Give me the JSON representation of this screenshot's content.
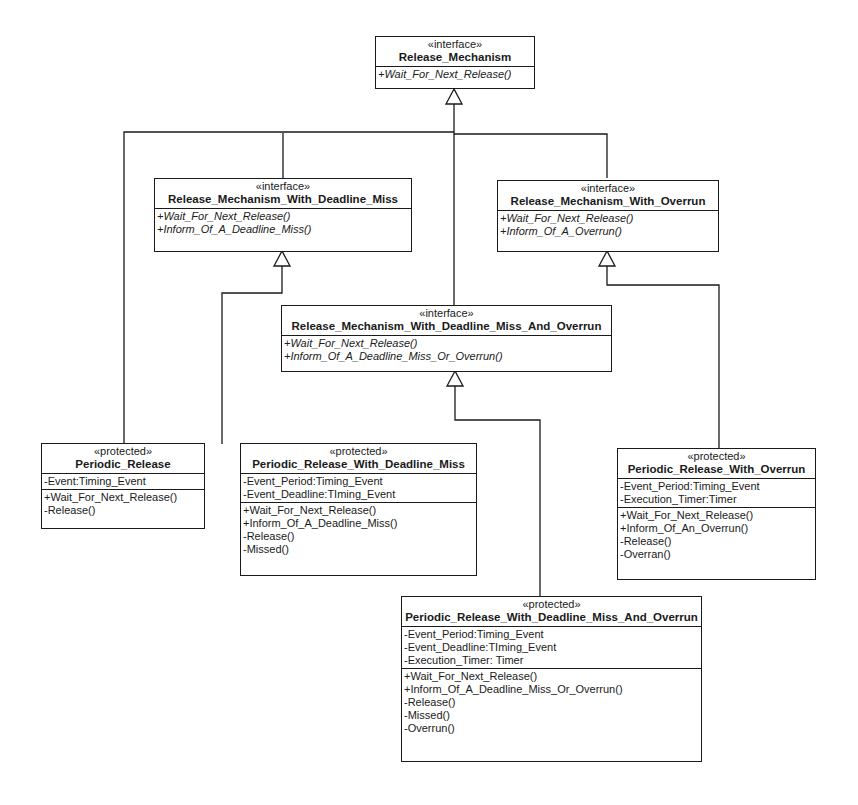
{
  "diagram": {
    "type": "UML class diagram",
    "classes": {
      "release_mechanism": {
        "stereotype": "«interface»",
        "name": "Release_Mechanism",
        "attributes": [],
        "operations": [
          "+Wait_For_Next_Release()"
        ]
      },
      "rm_deadline_miss": {
        "stereotype": "«interface»",
        "name": "Release_Mechanism_With_Deadline_Miss",
        "attributes": [],
        "operations": [
          "+Wait_For_Next_Release()",
          "+Inform_Of_A_Deadline_Miss()"
        ]
      },
      "rm_overrun": {
        "stereotype": "«interface»",
        "name": "Release_Mechanism_With_Overrun",
        "attributes": [],
        "operations": [
          "+Wait_For_Next_Release()",
          "+Inform_Of_A_Overrun()"
        ]
      },
      "rm_deadline_miss_and_overrun": {
        "stereotype": "«interface»",
        "name": "Release_Mechanism_With_Deadline_Miss_And_Overrun",
        "attributes": [],
        "operations": [
          "+Wait_For_Next_Release()",
          "+Inform_Of_A_Deadline_Miss_Or_Overrun()"
        ]
      },
      "periodic_release": {
        "stereotype": "«protected»",
        "name": "Periodic_Release",
        "attributes": [
          "-Event:Timing_Event"
        ],
        "operations": [
          "+Wait_For_Next_Release()",
          "-Release()"
        ]
      },
      "pr_deadline_miss": {
        "stereotype": "«protected»",
        "name": "Periodic_Release_With_Deadline_Miss",
        "attributes": [
          "-Event_Period:Timing_Event",
          "-Event_Deadline:TIming_Event"
        ],
        "operations": [
          "+Wait_For_Next_Release()",
          "+Inform_Of_A_Deadline_Miss()",
          "-Release()",
          "-Missed()"
        ]
      },
      "pr_overrun": {
        "stereotype": "«protected»",
        "name": "Periodic_Release_With_Overrun",
        "attributes": [
          "-Event_Period:Timing_Event",
          "-Execution_Timer:Timer"
        ],
        "operations": [
          "+Wait_For_Next_Release()",
          "+Inform_Of_An_Overrun()",
          "-Release()",
          "-Overran()"
        ]
      },
      "pr_deadline_miss_and_overrun": {
        "stereotype": "«protected»",
        "name": "Periodic_Release_With_Deadline_Miss_And_Overrun",
        "attributes": [
          "-Event_Period:Timing_Event",
          "-Event_Deadline:TIming_Event",
          "-Execution_Timer: Timer"
        ],
        "operations": [
          "+Wait_For_Next_Release()",
          "+Inform_Of_A_Deadline_Miss_Or_Overrun()",
          "-Release()",
          "-Missed()",
          "-Overrun()"
        ]
      }
    },
    "relationships": [
      {
        "from": "Periodic_Release",
        "to": "Release_Mechanism",
        "kind": "realization"
      },
      {
        "from": "Release_Mechanism_With_Deadline_Miss",
        "to": "Release_Mechanism",
        "kind": "generalization"
      },
      {
        "from": "Release_Mechanism_With_Overrun",
        "to": "Release_Mechanism",
        "kind": "generalization"
      },
      {
        "from": "Release_Mechanism_With_Deadline_Miss_And_Overrun",
        "to": "Release_Mechanism",
        "kind": "generalization"
      },
      {
        "from": "Periodic_Release_With_Deadline_Miss",
        "to": "Release_Mechanism_With_Deadline_Miss",
        "kind": "realization"
      },
      {
        "from": "Periodic_Release_With_Overrun",
        "to": "Release_Mechanism_With_Overrun",
        "kind": "realization"
      },
      {
        "from": "Periodic_Release_With_Deadline_Miss_And_Overrun",
        "to": "Release_Mechanism_With_Deadline_Miss_And_Overrun",
        "kind": "realization"
      }
    ],
    "colors": {
      "line": "#1a1a1a",
      "background": "#ffffff"
    }
  }
}
